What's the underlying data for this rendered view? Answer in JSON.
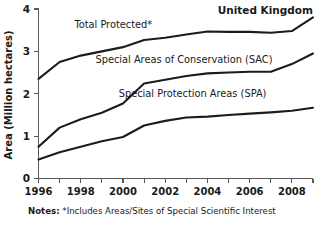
{
  "chart_data": {
    "type": "line",
    "title": "United Kingdom",
    "xlabel": "",
    "ylabel": "Area (Million hectares)",
    "xlim": [
      1996,
      2009
    ],
    "ylim": [
      0,
      4
    ],
    "grid": false,
    "legend_position": "inline-labels",
    "x": [
      1996,
      1997,
      1998,
      1999,
      2000,
      2001,
      2002,
      2003,
      2004,
      2005,
      2006,
      2007,
      2008,
      2009
    ],
    "x_tick_labels": [
      "1996",
      "1998",
      "2000",
      "2002",
      "2004",
      "2006",
      "2008"
    ],
    "x_tick_values": [
      1996,
      1998,
      2000,
      2002,
      2004,
      2006,
      2008
    ],
    "y_tick_labels": [
      "0",
      "1",
      "2",
      "3",
      "4"
    ],
    "y_tick_values": [
      0,
      1,
      2,
      3,
      4
    ],
    "series": [
      {
        "name": "Total Protected*",
        "values": [
          2.35,
          2.75,
          2.9,
          3.0,
          3.1,
          3.27,
          3.32,
          3.4,
          3.47,
          3.46,
          3.46,
          3.44,
          3.48,
          3.8
        ]
      },
      {
        "name": "Special Areas of Conservation (SAC)",
        "values": [
          0.75,
          1.2,
          1.4,
          1.55,
          1.77,
          2.24,
          2.33,
          2.42,
          2.48,
          2.5,
          2.52,
          2.52,
          2.7,
          2.95
        ]
      },
      {
        "name": "Special Protection Areas (SPA)",
        "values": [
          0.45,
          0.62,
          0.75,
          0.88,
          0.98,
          1.25,
          1.36,
          1.44,
          1.46,
          1.5,
          1.53,
          1.56,
          1.6,
          1.67
        ]
      }
    ],
    "annotations": [
      {
        "text": "Total Protected*",
        "x": 1997.7,
        "y": 3.55
      },
      {
        "text": "Special Areas of Conservation (SAC)",
        "x": 1998.7,
        "y": 2.72
      },
      {
        "text": "Special Protection Areas (SPA)",
        "x": 1999.8,
        "y": 1.92
      }
    ]
  },
  "footnote": {
    "label": "Notes:",
    "text": "*Includes Areas/Sites of Special Scientific Interest"
  }
}
